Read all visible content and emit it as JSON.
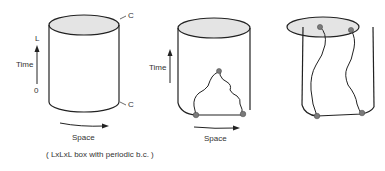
{
  "panels": [
    {
      "id": "panel-1",
      "time_axis": {
        "label": "Time",
        "top_tick": "L",
        "bottom_tick": "0"
      },
      "space_label": "Space",
      "caption": "( LxLxL box with periodic b.c. )",
      "side_labels": [
        "C",
        "C"
      ]
    },
    {
      "id": "panel-2",
      "time_axis": {
        "label": "Time"
      },
      "space_label": "Space"
    },
    {
      "id": "panel-3"
    }
  ],
  "colors": {
    "stroke": "#222222",
    "cap_fill": "#e4e4e4",
    "point": "#7a7a7a"
  }
}
